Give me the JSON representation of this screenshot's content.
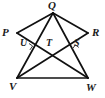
{
  "figure": {
    "kind": "geometry-diagram",
    "width": 105,
    "height": 98,
    "stroke_color": "#111111",
    "background_color": "#ffffff",
    "vertices": [
      {
        "name": "P",
        "label": "P",
        "x": 17,
        "y": 33
      },
      {
        "name": "Q",
        "label": "Q",
        "x": 53,
        "y": 13
      },
      {
        "name": "R",
        "label": "R",
        "x": 88,
        "y": 33
      },
      {
        "name": "V",
        "label": "V",
        "x": 17,
        "y": 78
      },
      {
        "name": "W",
        "label": "W",
        "x": 88,
        "y": 78
      }
    ],
    "intersections": [
      {
        "name": "U",
        "label": "U",
        "x": 29,
        "y": 46
      },
      {
        "name": "T",
        "label": "T",
        "x": 52,
        "y": 46
      },
      {
        "name": "S",
        "label": "S",
        "x": 76,
        "y": 46
      }
    ],
    "segments": [
      {
        "name": "P-Q",
        "from": "P",
        "to": "Q"
      },
      {
        "name": "Q-R",
        "from": "Q",
        "to": "R"
      },
      {
        "name": "Q-V",
        "from": "Q",
        "to": "V"
      },
      {
        "name": "Q-W",
        "from": "Q",
        "to": "W"
      },
      {
        "name": "V-W",
        "from": "V",
        "to": "W"
      },
      {
        "name": "P-W",
        "from": "P",
        "to": "W"
      },
      {
        "name": "R-V",
        "from": "R",
        "to": "V"
      }
    ],
    "right_angle_marks": [
      {
        "name": "right-angle-at-U",
        "at": "U"
      },
      {
        "name": "right-angle-at-S",
        "at": "S"
      }
    ]
  }
}
